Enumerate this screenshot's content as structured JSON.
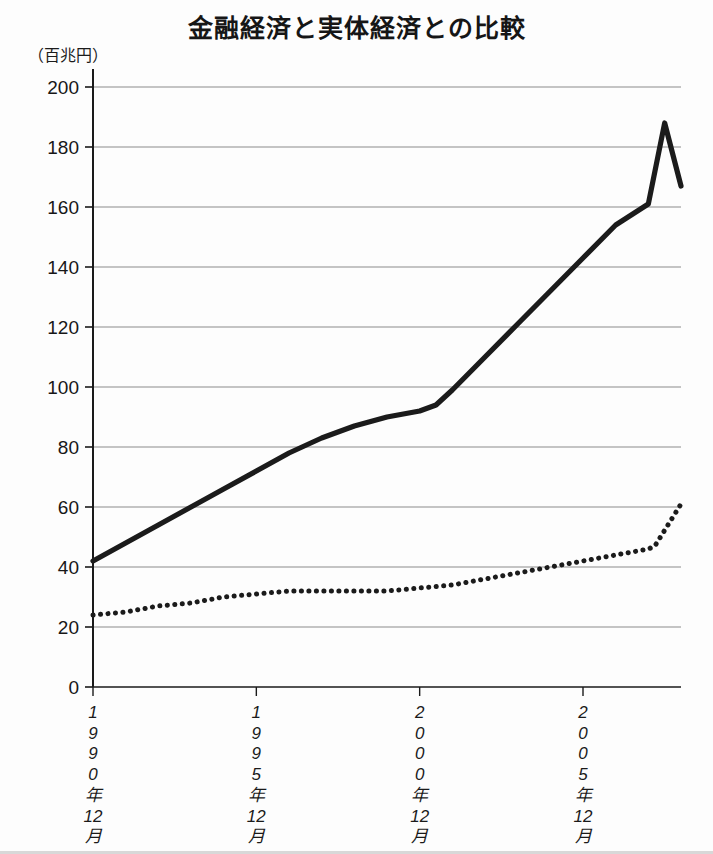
{
  "chart_data": {
    "type": "line",
    "title": "金融経済と実体経済との比較",
    "unit_label": "（百兆円）",
    "xlabel": "",
    "ylabel": "",
    "ylim": [
      0,
      200
    ],
    "ytick_step": 20,
    "yticks": [
      "0",
      "20",
      "40",
      "60",
      "80",
      "100",
      "120",
      "140",
      "160",
      "180",
      "200"
    ],
    "grid": "horizontal",
    "legend": "none",
    "xlim_years": [
      1990,
      2008
    ],
    "xticks": [
      {
        "year": 1990,
        "lines": [
          "1",
          "9",
          "9",
          "0",
          "年",
          "12",
          "月"
        ],
        "text": "1990年12月"
      },
      {
        "year": 1995,
        "lines": [
          "1",
          "9",
          "9",
          "5",
          "年",
          "12",
          "月"
        ],
        "text": "1995年12月"
      },
      {
        "year": 2000,
        "lines": [
          "2",
          "0",
          "0",
          "0",
          "年",
          "12",
          "月"
        ],
        "text": "2000年12月"
      },
      {
        "year": 2005,
        "lines": [
          "2",
          "0",
          "0",
          "5",
          "年",
          "12",
          "月"
        ],
        "text": "2005年12月"
      }
    ],
    "series": [
      {
        "name": "金融経済",
        "style": "solid",
        "color": "#1b1b1b",
        "x": [
          1990.0,
          1991.0,
          1992.0,
          1993.0,
          1994.0,
          1995.0,
          1996.0,
          1997.0,
          1998.0,
          1999.0,
          2000.0,
          2000.5,
          2001.0,
          2002.0,
          2003.0,
          2004.0,
          2005.0,
          2006.0,
          2007.0,
          2007.5,
          2008.0
        ],
        "values": [
          42,
          48,
          54,
          60,
          66,
          72,
          78,
          83,
          87,
          90,
          92,
          94,
          99,
          110,
          121,
          132,
          143,
          154,
          161,
          188,
          167
        ]
      },
      {
        "name": "実体経済",
        "style": "dotted",
        "color": "#1b1b1b",
        "x": [
          1990.0,
          1991.0,
          1992.0,
          1993.0,
          1994.0,
          1995.0,
          1996.0,
          1997.0,
          1998.0,
          1999.0,
          2000.0,
          2001.0,
          2002.0,
          2003.0,
          2004.0,
          2005.0,
          2006.0,
          2007.0,
          2007.2,
          2008.0
        ],
        "values": [
          24,
          25,
          27,
          28,
          30,
          31,
          32,
          32,
          32,
          32,
          33,
          34,
          36,
          38,
          40,
          42,
          44,
          46,
          47,
          61
        ]
      }
    ]
  }
}
